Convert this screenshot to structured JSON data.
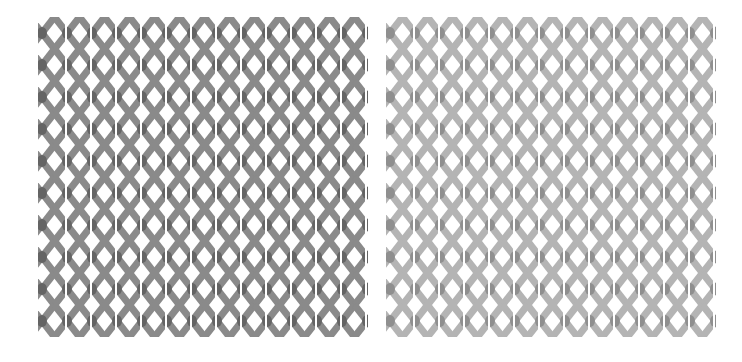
{
  "panels": [
    {
      "id": "left",
      "label": "",
      "columns": 12,
      "rows": 10,
      "tile_width": 25,
      "tile_height": 32,
      "colors": {
        "arm": "#8a8a8a",
        "core": "#5a5a5a",
        "background": "#ffffff"
      }
    },
    {
      "id": "right",
      "label": "",
      "columns": 12,
      "rows": 10,
      "tile_width": 25,
      "tile_height": 32,
      "colors": {
        "arm": "#b4b4b4",
        "core": "#868686",
        "background": "#ffffff"
      }
    }
  ]
}
